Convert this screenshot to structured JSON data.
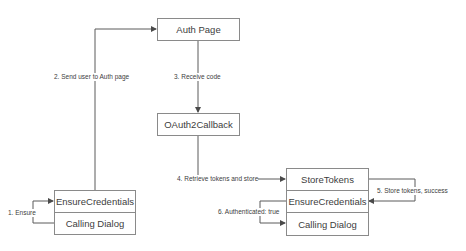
{
  "nodes": {
    "auth_page": "Auth Page",
    "oauth_callback": "OAuth2Callback",
    "left_stack": {
      "top": "EnsureCredentials",
      "bottom": "Calling Dialog"
    },
    "right_stack": {
      "top": "StoreTokens",
      "middle": "EnsureCredentials",
      "bottom": "Calling Dialog"
    }
  },
  "edges": {
    "step1": "1. Ensure",
    "step2": "2. Send user to Auth page",
    "step3": "3. Receive code",
    "step4": "4. Retrieve tokens and store",
    "step5": "5. Store tokens, success",
    "step6": "6. Authenticated: true"
  },
  "colors": {
    "line": "#5a5a5a",
    "border": "#8a8a8a",
    "text": "#404040"
  }
}
